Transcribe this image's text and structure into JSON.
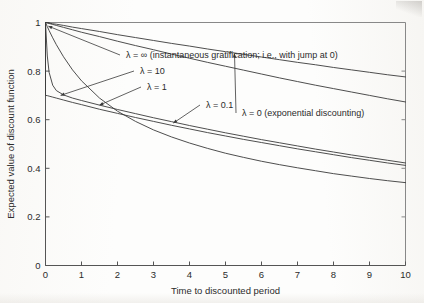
{
  "figure": {
    "name": "expected-value-of-discount-function-plot",
    "background_color": "#ffffff",
    "line_color": "#3a3a3a",
    "text_color": "#2b2b2b"
  },
  "chart_data": {
    "type": "line",
    "title": "",
    "xlabel": "Time to discounted period",
    "ylabel": "Expected value of discount function",
    "xlim": [
      0,
      10
    ],
    "ylim": [
      0,
      1
    ],
    "xticks": [
      0,
      1,
      2,
      3,
      4,
      5,
      6,
      7,
      8,
      9,
      10
    ],
    "xticklabels": [
      "0",
      "1",
      "2",
      "3",
      "4",
      "5",
      "6",
      "7",
      "8",
      "9",
      "10"
    ],
    "yticks": [
      0,
      0.2,
      0.4,
      0.6,
      0.8,
      1
    ],
    "yticklabels": [
      "0",
      "0.2",
      "0.4",
      "0.6",
      "0.8",
      "1"
    ],
    "grid": false,
    "legend": "inline-annotations",
    "x": [
      0,
      0.05,
      0.1,
      0.2,
      0.3,
      0.5,
      0.75,
      1,
      1.5,
      2,
      2.5,
      3,
      3.5,
      4,
      4.5,
      5,
      5.5,
      6,
      6.5,
      7,
      7.5,
      8,
      8.5,
      9,
      9.5,
      10
    ],
    "series": [
      {
        "name": "lambda-infinity",
        "label": "λ = ∞ (instantaneous gratification; i.e., with jump at 0)",
        "lambda": "∞",
        "jump_at_zero": true,
        "value_at_zero_plus": 0.7,
        "values": [
          1.0,
          0.699,
          0.697,
          0.693,
          0.689,
          0.681,
          0.671,
          0.662,
          0.643,
          0.626,
          0.609,
          0.593,
          0.577,
          0.562,
          0.547,
          0.533,
          0.519,
          0.506,
          0.493,
          0.48,
          0.468,
          0.456,
          0.444,
          0.433,
          0.422,
          0.412
        ]
      },
      {
        "name": "lambda-10",
        "label": "λ = 10",
        "lambda": "10",
        "jump_at_zero": false,
        "values": [
          1.0,
          0.862,
          0.795,
          0.742,
          0.72,
          0.702,
          0.689,
          0.679,
          0.66,
          0.642,
          0.625,
          0.608,
          0.592,
          0.576,
          0.561,
          0.546,
          0.532,
          0.518,
          0.505,
          0.492,
          0.479,
          0.467,
          0.455,
          0.444,
          0.433,
          0.422
        ]
      },
      {
        "name": "lambda-1",
        "label": "λ = 1",
        "lambda": "1",
        "jump_at_zero": false,
        "values": [
          1.0,
          0.983,
          0.967,
          0.937,
          0.909,
          0.859,
          0.805,
          0.76,
          0.689,
          0.635,
          0.593,
          0.558,
          0.529,
          0.504,
          0.482,
          0.462,
          0.445,
          0.429,
          0.415,
          0.402,
          0.39,
          0.378,
          0.368,
          0.358,
          0.349,
          0.341
        ]
      },
      {
        "name": "lambda-0.1",
        "label": "λ = 0.1",
        "lambda": "0.1",
        "jump_at_zero": false,
        "values": [
          1.0,
          0.998,
          0.996,
          0.992,
          0.988,
          0.98,
          0.97,
          0.96,
          0.942,
          0.923,
          0.905,
          0.888,
          0.87,
          0.853,
          0.836,
          0.82,
          0.804,
          0.788,
          0.772,
          0.757,
          0.742,
          0.728,
          0.714,
          0.7,
          0.686,
          0.673
        ]
      },
      {
        "name": "lambda-0",
        "label": "λ = 0 (exponential discounting)",
        "lambda": "0",
        "jump_at_zero": false,
        "values": [
          1.0,
          0.999,
          0.998,
          0.995,
          0.993,
          0.988,
          0.981,
          0.975,
          0.963,
          0.95,
          0.938,
          0.926,
          0.914,
          0.903,
          0.891,
          0.88,
          0.869,
          0.858,
          0.847,
          0.836,
          0.826,
          0.815,
          0.805,
          0.795,
          0.785,
          0.776
        ]
      }
    ],
    "annotations": [
      {
        "name": "annotation-lambda-infinity",
        "text": "λ = ∞ (instantaneous gratification; i.e., with jump at 0)"
      },
      {
        "name": "annotation-lambda-10",
        "text": "λ = 10"
      },
      {
        "name": "annotation-lambda-1",
        "text": "λ = 1"
      },
      {
        "name": "annotation-lambda-0-1",
        "text": "λ = 0.1"
      },
      {
        "name": "annotation-lambda-0",
        "text": "λ = 0 (exponential discounting)"
      }
    ]
  }
}
